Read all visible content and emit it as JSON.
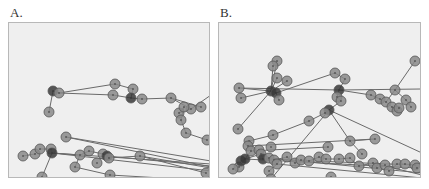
{
  "colors": {
    "background": "#efefef",
    "border": "#b8b8b8",
    "edge": "#6a6a6a",
    "node_fill": "#8a8a8a",
    "node_stroke": "#555555",
    "node_dark": "#3a3a3a"
  },
  "panels": [
    {
      "label": "A.",
      "left": 8,
      "width": 202,
      "height": 156,
      "nodes": [
        {
          "x": 44,
          "y": 68,
          "dark": true
        },
        {
          "x": 50,
          "y": 70
        },
        {
          "x": 40,
          "y": 89
        },
        {
          "x": 106,
          "y": 61
        },
        {
          "x": 104,
          "y": 72
        },
        {
          "x": 124,
          "y": 66
        },
        {
          "x": 122,
          "y": 75,
          "dark": true
        },
        {
          "x": 133,
          "y": 76
        },
        {
          "x": 162,
          "y": 75
        },
        {
          "x": 182,
          "y": 86
        },
        {
          "x": 192,
          "y": 84
        },
        {
          "x": 170,
          "y": 90
        },
        {
          "x": 175,
          "y": 84
        },
        {
          "x": 172,
          "y": 97
        },
        {
          "x": 177,
          "y": 110
        },
        {
          "x": 198,
          "y": 117
        },
        {
          "x": 57,
          "y": 114
        },
        {
          "x": 14,
          "y": 133
        },
        {
          "x": 26,
          "y": 131
        },
        {
          "x": 31,
          "y": 126
        },
        {
          "x": 42,
          "y": 126
        },
        {
          "x": 43,
          "y": 130,
          "dark": true
        },
        {
          "x": 71,
          "y": 132
        },
        {
          "x": 80,
          "y": 128
        },
        {
          "x": 94,
          "y": 131
        },
        {
          "x": 98,
          "y": 133,
          "dark": true
        },
        {
          "x": 100,
          "y": 135
        },
        {
          "x": 88,
          "y": 140
        },
        {
          "x": 66,
          "y": 144
        },
        {
          "x": 131,
          "y": 133
        },
        {
          "x": 33,
          "y": 154
        },
        {
          "x": 101,
          "y": 152
        },
        {
          "x": 197,
          "y": 150
        }
      ],
      "edges": [
        [
          0,
          2
        ],
        [
          0,
          1
        ],
        [
          1,
          3
        ],
        [
          1,
          4
        ],
        [
          3,
          5
        ],
        [
          4,
          6
        ],
        [
          5,
          6
        ],
        [
          6,
          7
        ],
        [
          7,
          8
        ],
        [
          8,
          9
        ],
        [
          8,
          10
        ],
        [
          9,
          11
        ],
        [
          11,
          12
        ],
        [
          12,
          13
        ],
        [
          13,
          14
        ],
        [
          14,
          15
        ],
        [
          9,
          202
        ],
        [
          16,
          300
        ],
        [
          16,
          301
        ],
        [
          17,
          18
        ],
        [
          18,
          19
        ],
        [
          19,
          20
        ],
        [
          20,
          21
        ],
        [
          21,
          22
        ],
        [
          22,
          23
        ],
        [
          23,
          24
        ],
        [
          24,
          25
        ],
        [
          25,
          26
        ],
        [
          26,
          29
        ],
        [
          29,
          302
        ],
        [
          21,
          303
        ],
        [
          21,
          304
        ],
        [
          25,
          305
        ],
        [
          22,
          28
        ],
        [
          21,
          30
        ],
        [
          28,
          31
        ],
        [
          31,
          306
        ],
        [
          29,
          32
        ]
      ],
      "ext": {
        "202": {
          "x": 202,
          "y": 72
        },
        "300": {
          "x": 202,
          "y": 144
        },
        "301": {
          "x": 202,
          "y": 138
        },
        "302": {
          "x": 202,
          "y": 145
        },
        "303": {
          "x": 202,
          "y": 141
        },
        "304": {
          "x": 202,
          "y": 148
        },
        "305": {
          "x": 202,
          "y": 143
        },
        "306": {
          "x": 170,
          "y": 156
        }
      }
    },
    {
      "label": "B.",
      "left": 218,
      "width": 203,
      "height": 156,
      "nodes": [
        {
          "x": 58,
          "y": 38
        },
        {
          "x": 54,
          "y": 43
        },
        {
          "x": 58,
          "y": 55
        },
        {
          "x": 68,
          "y": 58
        },
        {
          "x": 20,
          "y": 65
        },
        {
          "x": 22,
          "y": 75
        },
        {
          "x": 52,
          "y": 68,
          "dark": true
        },
        {
          "x": 57,
          "y": 70,
          "dark": true
        },
        {
          "x": 60,
          "y": 77
        },
        {
          "x": 19,
          "y": 106
        },
        {
          "x": 116,
          "y": 50
        },
        {
          "x": 126,
          "y": 56
        },
        {
          "x": 120,
          "y": 67,
          "dark": true
        },
        {
          "x": 118,
          "y": 74
        },
        {
          "x": 122,
          "y": 78
        },
        {
          "x": 110,
          "y": 87,
          "dark": true
        },
        {
          "x": 106,
          "y": 90
        },
        {
          "x": 90,
          "y": 98
        },
        {
          "x": 152,
          "y": 72
        },
        {
          "x": 161,
          "y": 76
        },
        {
          "x": 167,
          "y": 79
        },
        {
          "x": 176,
          "y": 67
        },
        {
          "x": 196,
          "y": 38
        },
        {
          "x": 187,
          "y": 77
        },
        {
          "x": 192,
          "y": 84
        },
        {
          "x": 173,
          "y": 84
        },
        {
          "x": 178,
          "y": 88
        },
        {
          "x": 180,
          "y": 85
        },
        {
          "x": 54,
          "y": 112
        },
        {
          "x": 30,
          "y": 118
        },
        {
          "x": 29,
          "y": 123
        },
        {
          "x": 32,
          "y": 128
        },
        {
          "x": 40,
          "y": 127
        },
        {
          "x": 52,
          "y": 124
        },
        {
          "x": 109,
          "y": 124
        },
        {
          "x": 131,
          "y": 118
        },
        {
          "x": 156,
          "y": 116
        },
        {
          "x": 143,
          "y": 131
        },
        {
          "x": 20,
          "y": 144
        },
        {
          "x": 22,
          "y": 138,
          "dark": true
        },
        {
          "x": 26,
          "y": 136,
          "dark": true
        },
        {
          "x": 14,
          "y": 146
        },
        {
          "x": 42,
          "y": 131
        },
        {
          "x": 44,
          "y": 136,
          "dark": true
        },
        {
          "x": 50,
          "y": 135
        },
        {
          "x": 55,
          "y": 137
        },
        {
          "x": 58,
          "y": 141
        },
        {
          "x": 50,
          "y": 148
        },
        {
          "x": 68,
          "y": 134
        },
        {
          "x": 76,
          "y": 140
        },
        {
          "x": 82,
          "y": 137
        },
        {
          "x": 90,
          "y": 138
        },
        {
          "x": 100,
          "y": 134
        },
        {
          "x": 107,
          "y": 136
        },
        {
          "x": 120,
          "y": 136
        },
        {
          "x": 131,
          "y": 135
        },
        {
          "x": 140,
          "y": 143
        },
        {
          "x": 154,
          "y": 140
        },
        {
          "x": 158,
          "y": 145
        },
        {
          "x": 166,
          "y": 142
        },
        {
          "x": 170,
          "y": 148
        },
        {
          "x": 178,
          "y": 141
        },
        {
          "x": 186,
          "y": 141
        },
        {
          "x": 196,
          "y": 142
        },
        {
          "x": 198,
          "y": 145
        },
        {
          "x": 52,
          "y": 156
        },
        {
          "x": 112,
          "y": 154
        }
      ],
      "edges": [
        [
          0,
          6
        ],
        [
          1,
          6
        ],
        [
          2,
          6
        ],
        [
          3,
          6
        ],
        [
          4,
          6
        ],
        [
          5,
          6
        ],
        [
          6,
          7
        ],
        [
          7,
          8
        ],
        [
          6,
          9
        ],
        [
          4,
          12
        ],
        [
          7,
          10
        ],
        [
          10,
          11
        ],
        [
          11,
          12
        ],
        [
          12,
          13
        ],
        [
          13,
          14
        ],
        [
          14,
          15
        ],
        [
          15,
          16
        ],
        [
          16,
          17
        ],
        [
          17,
          28
        ],
        [
          28,
          29
        ],
        [
          12,
          18
        ],
        [
          18,
          19
        ],
        [
          19,
          20
        ],
        [
          20,
          21
        ],
        [
          21,
          22
        ],
        [
          21,
          23
        ],
        [
          23,
          24
        ],
        [
          20,
          25
        ],
        [
          25,
          26
        ],
        [
          26,
          27
        ],
        [
          12,
          200
        ],
        [
          15,
          65
        ],
        [
          15,
          35
        ],
        [
          35,
          36
        ],
        [
          35,
          37
        ],
        [
          15,
          201
        ],
        [
          30,
          36
        ],
        [
          31,
          34
        ],
        [
          31,
          38
        ],
        [
          38,
          39
        ],
        [
          39,
          40
        ],
        [
          40,
          41
        ],
        [
          40,
          42
        ],
        [
          42,
          43
        ],
        [
          43,
          44
        ],
        [
          44,
          45
        ],
        [
          45,
          46
        ],
        [
          46,
          47
        ],
        [
          45,
          48
        ],
        [
          48,
          49
        ],
        [
          49,
          50
        ],
        [
          50,
          51
        ],
        [
          51,
          52
        ],
        [
          52,
          53
        ],
        [
          53,
          54
        ],
        [
          54,
          55
        ],
        [
          55,
          56
        ],
        [
          56,
          57
        ],
        [
          57,
          58
        ],
        [
          58,
          59
        ],
        [
          59,
          60
        ],
        [
          60,
          61
        ],
        [
          61,
          62
        ],
        [
          62,
          63
        ],
        [
          63,
          64
        ],
        [
          40,
          64
        ],
        [
          43,
          63
        ],
        [
          44,
          202
        ],
        [
          46,
          203
        ],
        [
          57,
          204
        ]
      ],
      "ext": {
        "200": {
          "x": 203,
          "y": 66
        },
        "201": {
          "x": 203,
          "y": 130
        },
        "202": {
          "x": 203,
          "y": 150
        },
        "203": {
          "x": 203,
          "y": 155
        },
        "204": {
          "x": 203,
          "y": 152
        }
      }
    }
  ]
}
